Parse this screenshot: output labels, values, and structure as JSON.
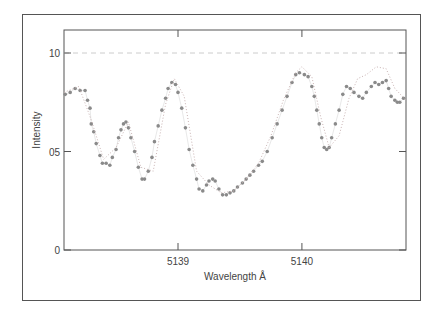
{
  "chart_data": {
    "type": "scatter",
    "title": "",
    "xlabel": "Wavelength Å",
    "ylabel": "Intensity",
    "xlim": [
      5138.08,
      5140.84
    ],
    "ylim": [
      0,
      1.12
    ],
    "x_ticks": [
      {
        "value": 5139,
        "label": "5139"
      },
      {
        "value": 5140,
        "label": "5140"
      }
    ],
    "y_ticks": [
      {
        "value": 0,
        "label": "0"
      },
      {
        "value": 0.5,
        "label": "05"
      },
      {
        "value": 1.0,
        "label": "10"
      }
    ],
    "reference_line": {
      "y": 1.0,
      "style": "dashed"
    },
    "grid": false,
    "legend": null,
    "series": [
      {
        "name": "observed",
        "style": "markers",
        "color": "#8a8a8a",
        "x": [
          5138.09,
          5138.13,
          5138.17,
          5138.21,
          5138.25,
          5138.27,
          5138.29,
          5138.3,
          5138.32,
          5138.34,
          5138.37,
          5138.39,
          5138.42,
          5138.45,
          5138.47,
          5138.5,
          5138.52,
          5138.54,
          5138.56,
          5138.58,
          5138.6,
          5138.62,
          5138.65,
          5138.68,
          5138.71,
          5138.73,
          5138.76,
          5138.79,
          5138.81,
          5138.84,
          5138.87,
          5138.9,
          5138.92,
          5138.95,
          5138.98,
          5139.0,
          5139.03,
          5139.06,
          5139.09,
          5139.12,
          5139.15,
          5139.17,
          5139.2,
          5139.23,
          5139.25,
          5139.28,
          5139.3,
          5139.33,
          5139.36,
          5139.39,
          5139.42,
          5139.45,
          5139.48,
          5139.52,
          5139.55,
          5139.58,
          5139.61,
          5139.65,
          5139.68,
          5139.72,
          5139.76,
          5139.8,
          5139.84,
          5139.88,
          5139.92,
          5139.95,
          5139.98,
          5140.02,
          5140.05,
          5140.08,
          5140.1,
          5140.12,
          5140.14,
          5140.16,
          5140.18,
          5140.2,
          5140.22,
          5140.24,
          5140.27,
          5140.3,
          5140.33,
          5140.36,
          5140.39,
          5140.42,
          5140.46,
          5140.49,
          5140.52,
          5140.56,
          5140.59,
          5140.62,
          5140.65,
          5140.68,
          5140.7,
          5140.72,
          5140.75,
          5140.77,
          5140.79,
          5140.82
        ],
        "y": [
          0.79,
          0.8,
          0.82,
          0.81,
          0.81,
          0.76,
          0.72,
          0.64,
          0.6,
          0.54,
          0.48,
          0.44,
          0.44,
          0.43,
          0.47,
          0.51,
          0.57,
          0.61,
          0.64,
          0.65,
          0.62,
          0.57,
          0.5,
          0.42,
          0.36,
          0.36,
          0.4,
          0.47,
          0.55,
          0.63,
          0.71,
          0.77,
          0.82,
          0.85,
          0.84,
          0.8,
          0.72,
          0.62,
          0.51,
          0.43,
          0.36,
          0.31,
          0.3,
          0.33,
          0.35,
          0.36,
          0.35,
          0.31,
          0.28,
          0.28,
          0.29,
          0.3,
          0.32,
          0.34,
          0.36,
          0.38,
          0.4,
          0.43,
          0.45,
          0.5,
          0.57,
          0.64,
          0.71,
          0.78,
          0.85,
          0.89,
          0.9,
          0.89,
          0.88,
          0.83,
          0.78,
          0.71,
          0.64,
          0.57,
          0.52,
          0.51,
          0.52,
          0.57,
          0.64,
          0.71,
          0.79,
          0.83,
          0.82,
          0.8,
          0.78,
          0.77,
          0.8,
          0.83,
          0.85,
          0.84,
          0.85,
          0.86,
          0.82,
          0.78,
          0.76,
          0.75,
          0.75,
          0.77
        ]
      },
      {
        "name": "model",
        "style": "dotted-line",
        "color": "#c9b3b3",
        "x": [
          5138.08,
          5138.2,
          5138.3,
          5138.4,
          5138.5,
          5138.6,
          5138.7,
          5138.8,
          5138.9,
          5138.97,
          5139.05,
          5139.15,
          5139.25,
          5139.35,
          5139.45,
          5139.55,
          5139.65,
          5139.75,
          5139.85,
          5139.95,
          5140.0,
          5140.08,
          5140.15,
          5140.22,
          5140.3,
          5140.38,
          5140.45,
          5140.52,
          5140.6,
          5140.68,
          5140.75,
          5140.84
        ],
        "y": [
          0.8,
          0.83,
          0.66,
          0.46,
          0.52,
          0.65,
          0.42,
          0.4,
          0.74,
          0.87,
          0.78,
          0.4,
          0.33,
          0.29,
          0.3,
          0.36,
          0.44,
          0.58,
          0.76,
          0.9,
          0.93,
          0.88,
          0.68,
          0.52,
          0.58,
          0.77,
          0.87,
          0.89,
          0.93,
          0.92,
          0.82,
          0.76
        ]
      }
    ]
  }
}
